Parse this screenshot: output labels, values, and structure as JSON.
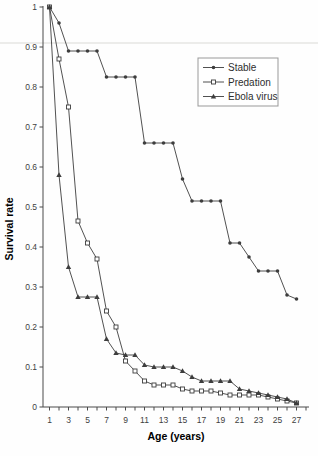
{
  "figure": {
    "background": "#fefefe",
    "line_color": "#3d3d3d",
    "text_color": "#2e2e2e",
    "tick_text_color": "#3f3f3f",
    "legend_border_color": "#999999",
    "marker_fill_open": "#ffffff"
  },
  "chart_data": {
    "type": "line",
    "title": "",
    "xlabel": "Age (years)",
    "ylabel": "Survival rate",
    "xlim": [
      1,
      27
    ],
    "ylim": [
      0,
      1
    ],
    "grid": false,
    "legend_position": "upper right",
    "y_ticks": [
      {
        "label": "1",
        "value": 1.0
      },
      {
        "label": "0.9",
        "value": 0.9
      },
      {
        "label": "0.8",
        "value": 0.8
      },
      {
        "label": "0.7",
        "value": 0.7
      },
      {
        "label": "0.6",
        "value": 0.6
      },
      {
        "label": "0.5",
        "value": 0.5
      },
      {
        "label": "0.4",
        "value": 0.4
      },
      {
        "label": "0.3",
        "value": 0.3
      },
      {
        "label": "0.2",
        "value": 0.2
      },
      {
        "label": "0.1",
        "value": 0.1
      },
      {
        "label": "0",
        "value": 0.0
      }
    ],
    "x_labeled_ticks": [
      1,
      3,
      5,
      7,
      9,
      11,
      13,
      15,
      17,
      19,
      21,
      23,
      25,
      27
    ],
    "x_minor_ticks": [
      1,
      2,
      3,
      4,
      5,
      6,
      7,
      8,
      9,
      10,
      11,
      12,
      13,
      14,
      15,
      16,
      17,
      18,
      19,
      20,
      21,
      22,
      23,
      24,
      25,
      26,
      27,
      28
    ],
    "x": [
      1,
      2,
      3,
      4,
      5,
      6,
      7,
      8,
      9,
      10,
      11,
      12,
      13,
      14,
      15,
      16,
      17,
      18,
      19,
      20,
      21,
      22,
      23,
      24,
      25,
      26,
      27
    ],
    "series": [
      {
        "name": "Stable",
        "marker": "filled-circle",
        "values": [
          1.0,
          0.96,
          0.89,
          0.89,
          0.89,
          0.89,
          0.825,
          0.825,
          0.825,
          0.825,
          0.66,
          0.66,
          0.66,
          0.66,
          0.57,
          0.515,
          0.515,
          0.515,
          0.515,
          0.41,
          0.41,
          0.375,
          0.34,
          0.34,
          0.34,
          0.28,
          0.27
        ]
      },
      {
        "name": "Predation",
        "marker": "open-square",
        "values": [
          1.0,
          0.87,
          0.75,
          0.465,
          0.41,
          0.37,
          0.24,
          0.2,
          0.115,
          0.09,
          0.065,
          0.055,
          0.055,
          0.055,
          0.045,
          0.04,
          0.04,
          0.04,
          0.035,
          0.03,
          0.03,
          0.03,
          0.03,
          0.025,
          0.02,
          0.015,
          0.01
        ]
      },
      {
        "name": "Ebola virus",
        "marker": "filled-triangle",
        "values": [
          1.0,
          0.58,
          0.35,
          0.275,
          0.275,
          0.275,
          0.17,
          0.135,
          0.13,
          0.13,
          0.105,
          0.1,
          0.1,
          0.1,
          0.09,
          0.075,
          0.065,
          0.065,
          0.065,
          0.065,
          0.045,
          0.04,
          0.035,
          0.03,
          0.025,
          0.02,
          0.01
        ]
      }
    ]
  }
}
